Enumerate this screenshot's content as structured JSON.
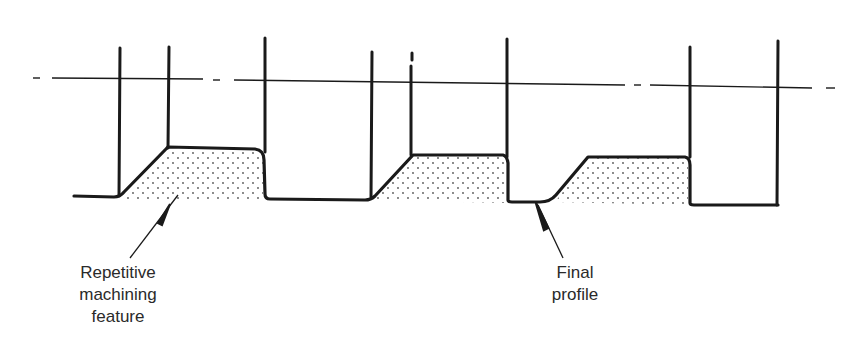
{
  "diagram": {
    "type": "machining-profile-cross-section",
    "colors": {
      "ink": "#1a1a1a",
      "text": "#2a2a2a",
      "stipple": "#555555",
      "background": "#ffffff"
    },
    "labels": {
      "repetitive_feature": {
        "lines": [
          "Repetitive",
          "machining",
          "feature"
        ]
      },
      "final_profile": {
        "lines": [
          "Final",
          "profile"
        ]
      }
    },
    "centerline": {
      "style": "dash-dot",
      "y_left": 78,
      "y_right": 88
    },
    "vertical_lines_x": [
      120,
      168,
      265,
      372,
      412,
      507,
      587,
      690,
      778
    ]
  }
}
